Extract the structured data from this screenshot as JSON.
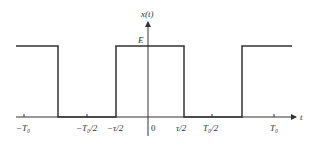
{
  "diagram": {
    "type": "periodic rectangular pulse train",
    "y_axis_label": "x(t)",
    "x_axis_label": "t",
    "amplitude_label": "E",
    "x_tick_labels": [
      "−T₀",
      "−T₀/2",
      "−τ/2",
      "0",
      "τ/2",
      "T₀/2",
      "T₀"
    ],
    "colors": {
      "line": "#333333",
      "background": "#ffffff"
    }
  }
}
